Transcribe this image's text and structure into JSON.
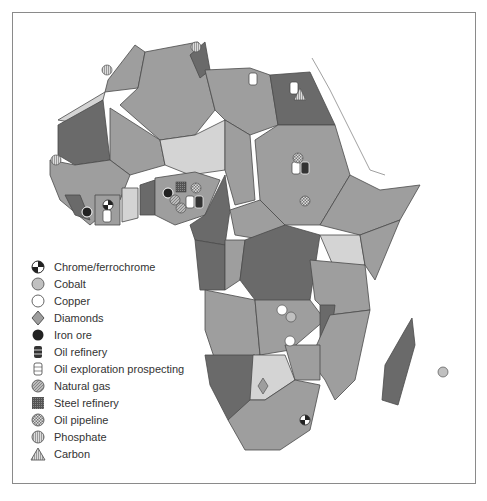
{
  "map": {
    "title": "Mineral resources of Africa",
    "colors": {
      "light": "#d4d4d4",
      "medium": "#9e9e9e",
      "dark": "#6a6a6a",
      "border": "#4a4a4a"
    }
  },
  "legend": {
    "items": [
      {
        "icon": "chrome-ferrochrome-icon",
        "label": "Chrome/ferrochrome"
      },
      {
        "icon": "cobalt-icon",
        "label": "Cobalt"
      },
      {
        "icon": "copper-icon",
        "label": "Copper"
      },
      {
        "icon": "diamonds-icon",
        "label": "Diamonds"
      },
      {
        "icon": "iron-ore-icon",
        "label": "Iron ore"
      },
      {
        "icon": "oil-refinery-icon",
        "label": "Oil refinery"
      },
      {
        "icon": "oil-exploration-icon",
        "label": "Oil exploration prospecting"
      },
      {
        "icon": "natural-gas-icon",
        "label": "Natural gas"
      },
      {
        "icon": "steel-refinery-icon",
        "label": "Steel refinery"
      },
      {
        "icon": "oil-pipeline-icon",
        "label": "Oil pipeline"
      },
      {
        "icon": "phosphate-icon",
        "label": "Phosphate"
      },
      {
        "icon": "carbon-icon",
        "label": "Carbon"
      }
    ]
  }
}
